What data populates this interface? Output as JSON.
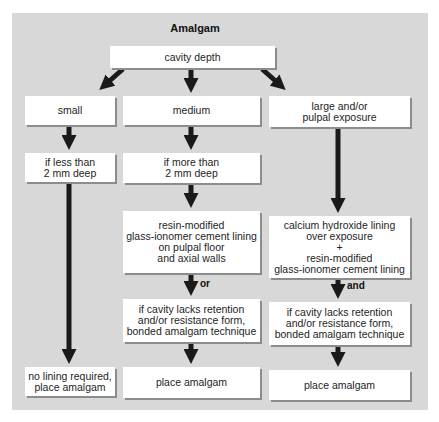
{
  "title": "Amalgam",
  "root": "cavity depth",
  "columns": [
    {
      "id": "small",
      "steps": [
        "small",
        "if less than\n2 mm deep",
        "no lining required,\nplace amalgam"
      ]
    },
    {
      "id": "medium",
      "steps": [
        "medium",
        "if more than\n2 mm deep",
        "resin-modified\nglass-ionomer cement lining\non pulpal floor\nand axial walls",
        "if cavity lacks retention\nand/or resistance form,\nbonded amalgam technique",
        "place amalgam"
      ],
      "connector": "or"
    },
    {
      "id": "large",
      "steps": [
        "large and/or\npulpal exposure",
        "calcium hydroxide lining\nover exposure\n+\nresin-modified\nglass-ionomer cement lining",
        "if cavity lacks retention\nand/or resistance form,\nbonded amalgam technique",
        "place amalgam"
      ],
      "connector": "and"
    }
  ],
  "colors": {
    "panel": "#d8d8d8",
    "box": "#ffffff",
    "arrow": "#1a1a1a",
    "shadow": "#8c8c8c"
  }
}
